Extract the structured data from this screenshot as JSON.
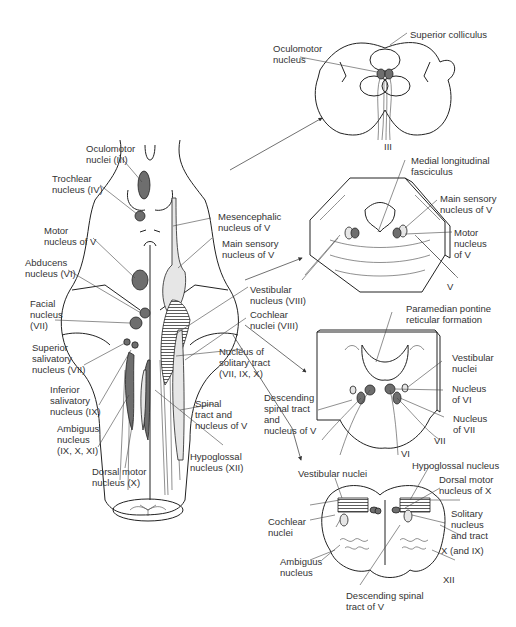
{
  "colors": {
    "background": "#ffffff",
    "outline": "#222222",
    "motor_nucleus_fill": "#6e6e6e",
    "sensory_nucleus_fill": "#e6e6e6",
    "text": "#333333"
  },
  "dorsal_view": {
    "labels": {
      "oculomotor_nuclei": "Oculomotor\nnuclei (III)",
      "trochlear_nucleus": "Trochlear\nnucleus (IV)",
      "motor_nucleus_v": "Motor\nnucleus of V",
      "abducens_nucleus": "Abducens\nnucleus (VI)",
      "facial_nucleus": "Facial\nnucleus\n(VII)",
      "superior_salivatory": "Superior\nsalivatory\nnucleus (VII)",
      "inferior_salivatory": "Inferior\nsalivatory\nnucleus (IX)",
      "ambiguus_nucleus": "Ambiguus\nnucleus\n(IX, X, XI)",
      "dorsal_motor_nucleus": "Dorsal motor\nnucleus (X)",
      "mesencephalic_nucleus": "Mesencephalic\nnucleus of V",
      "main_sensory_nucleus": "Main sensory\nnucleus of V",
      "vestibular_nucleus": "Vestibular\nnucleus (VIII)",
      "cochlear_nuclei": "Cochlear\nnuclei (VIII)",
      "solitary_tract_nucleus": "Nucleus of\nsolitary tract\n(VII, IX, X)",
      "spinal_tract_v": "Spinal\ntract and\nnucleus of V",
      "hypoglossal_nucleus": "Hypoglossal\nnucleus (XII)"
    }
  },
  "section_midbrain": {
    "labels": {
      "superior_colliculus": "Superior colliculus",
      "oculomotor_nucleus": "Oculomotor\nnucleus",
      "nerve_iii": "III"
    }
  },
  "section_upper_pons": {
    "labels": {
      "mlf": "Medial longitudinal\nfasciculus",
      "main_sensory_v": "Main sensory\nnucleus of V",
      "motor_nucleus_v": "Motor\nnucleus\nof V",
      "nerve_v": "V"
    }
  },
  "section_lower_pons": {
    "labels": {
      "pprf": "Paramedian pontine\nreticular formation",
      "vestibular_nuclei": "Vestibular\nnuclei",
      "nucleus_vi": "Nucleus\nof VI",
      "nucleus_vii": "Nucleus\nof VII",
      "descending_spinal_tract": "Descending\nspinal tract\nand\nnucleus of V",
      "nerve_vii": "VII",
      "nerve_vi": "VI"
    }
  },
  "section_medulla": {
    "labels": {
      "vestibular_nuclei": "Vestibular nuclei",
      "hypoglossal_nucleus": "Hypoglossal nucleus",
      "dorsal_motor_x": "Dorsal motor\nnucleus of X",
      "cochlear_nuclei": "Cochlear\nnuclei",
      "solitary_nucleus": "Solitary\nnucleus\nand tract",
      "ambiguus_nucleus": "Ambiguus\nnucleus",
      "nerve_x_ix": "X (and IX)",
      "nerve_xii": "XII",
      "descending_spinal_tract_v": "Descending spinal\ntract of V"
    }
  }
}
